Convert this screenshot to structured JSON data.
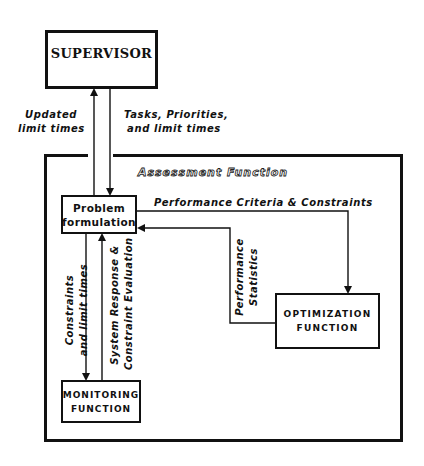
{
  "diagram": {
    "nodes": {
      "supervisor": {
        "label": "SUPERVISOR"
      },
      "problem_formulation": {
        "line1": "Problem",
        "line2": "formulation"
      },
      "optimization": {
        "line1": "OPTIMIZATION",
        "line2": "FUNCTION"
      },
      "monitoring": {
        "line1": "MONITORING",
        "line2": "FUNCTION"
      }
    },
    "group": {
      "assessment_function": {
        "label": "Assessment Function"
      }
    },
    "edges": {
      "problem_to_supervisor": {
        "line1": "Updated",
        "line2": "limit times"
      },
      "supervisor_to_problem": {
        "line1": "Tasks, Priorities,",
        "line2": "and limit times"
      },
      "problem_to_optimization": {
        "label": "Performance Criteria & Constraints"
      },
      "optimization_to_problem": {
        "line1": "Performance",
        "line2": "Statistics"
      },
      "problem_to_monitoring": {
        "line1": "Constraints",
        "line2": "and limit times"
      },
      "monitoring_to_problem": {
        "line1": "System Response &",
        "line2": "Constraint Evaluation"
      }
    },
    "colors": {
      "stroke": "#111111",
      "background": "#ffffff"
    }
  }
}
